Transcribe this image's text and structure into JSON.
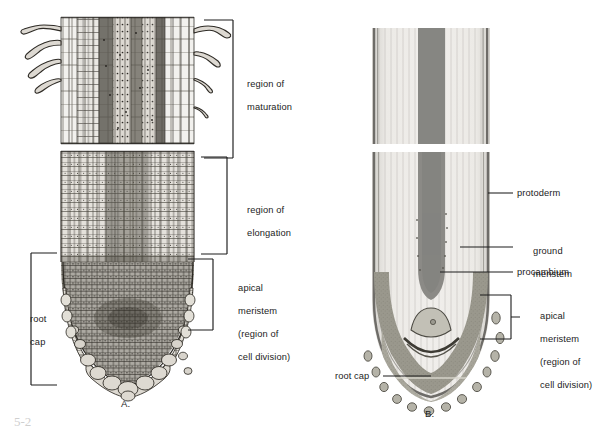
{
  "figure": {
    "background_color": "#ffffff",
    "ink_color": "#1c1c1c",
    "caption_fragment": "5-2"
  },
  "panels": [
    {
      "id": "A",
      "letter": "A.",
      "style": "detailed cellular line drawing, longitudinal section of root tip with root hairs",
      "labels": [
        {
          "name": "region-of-maturation",
          "text": "region of\nmaturation",
          "marker": "bracket"
        },
        {
          "name": "region-of-elongation",
          "text": "region of\nelongation",
          "marker": "bracket"
        },
        {
          "name": "apical-meristem",
          "text": "apical\nmeristem\n(region of\ncell division)",
          "marker": "bracket"
        },
        {
          "name": "root-cap",
          "text": "root\ncap",
          "marker": "bracket"
        }
      ]
    },
    {
      "id": "B",
      "letter": "B.",
      "style": "tonal shaded rendering of root tip showing tissue zones",
      "colors": {
        "body": "#e6e5e2",
        "procambium": "#8c8c8a",
        "meristem": "#9a998f",
        "rootcap": "#b3b2a8",
        "protoderm": "#6e6e6c"
      },
      "labels": [
        {
          "name": "protoderm",
          "text": "protoderm",
          "marker": "leader-line"
        },
        {
          "name": "ground-meristem",
          "text": "ground\nmeristem",
          "marker": "leader-line"
        },
        {
          "name": "procambium",
          "text": "procambium",
          "marker": "leader-line"
        },
        {
          "name": "apical-meristem",
          "text": "apical\nmeristem\n(region of\ncell division)",
          "marker": "bracket"
        },
        {
          "name": "root-cap",
          "text": "root cap",
          "marker": "leader-line"
        }
      ]
    }
  ],
  "labels_flat": {
    "a_maturation_l1": "region of",
    "a_maturation_l2": "maturation",
    "a_elongation_l1": "region of",
    "a_elongation_l2": "elongation",
    "a_apical_l1": "apical",
    "a_apical_l2": "meristem",
    "a_apical_l3": "(region of",
    "a_apical_l4": "cell division)",
    "a_rootcap_l1": "root",
    "a_rootcap_l2": "cap",
    "a_letter": "A.",
    "b_protoderm": "protoderm",
    "b_ground_l1": "ground",
    "b_ground_l2": "meristem",
    "b_procambium": "procambium",
    "b_apical_l1": "apical",
    "b_apical_l2": "meristem",
    "b_apical_l3": "(region of",
    "b_apical_l4": "cell division)",
    "b_rootcap": "root cap",
    "b_letter": "B.",
    "caption_fragment": "5-2"
  }
}
